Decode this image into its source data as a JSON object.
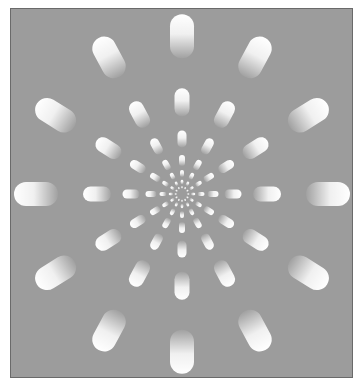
{
  "figure": {
    "type": "radial-capsule-illusion",
    "background_color": "#9c9c9c",
    "capsule_color": "#ffffff",
    "center": [
      182,
      194
    ],
    "vertical_scale": 1.08,
    "spokes": 12,
    "rings": [
      {
        "radius": 146,
        "length": 44,
        "width": 24
      },
      {
        "radius": 85,
        "length": 28,
        "width": 15
      },
      {
        "radius": 51,
        "length": 17,
        "width": 9
      },
      {
        "radius": 31,
        "length": 11,
        "width": 6
      },
      {
        "radius": 19,
        "length": 7,
        "width": 4
      },
      {
        "radius": 11,
        "length": 4.5,
        "width": 2.6
      },
      {
        "radius": 6,
        "length": 2.6,
        "width": 1.6
      }
    ]
  }
}
